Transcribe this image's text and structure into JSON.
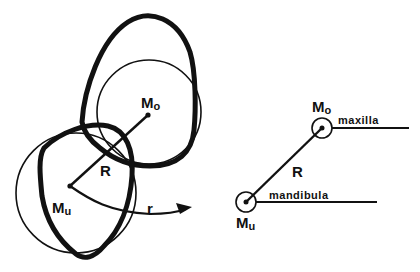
{
  "figure": {
    "left_panel": {
      "upper_center_label": "M",
      "upper_center_sub": "o",
      "lower_center_label": "M",
      "lower_center_sub": "u",
      "radius_label": "R",
      "rotation_label": "r"
    },
    "right_panel": {
      "upper_center_label": "M",
      "upper_center_sub": "o",
      "upper_line_label": "maxilla",
      "lower_center_label": "M",
      "lower_center_sub": "u",
      "lower_line_label": "mandibula",
      "radius_label": "R"
    },
    "colors": {
      "ink": "#111111",
      "background": "#ffffff"
    }
  }
}
